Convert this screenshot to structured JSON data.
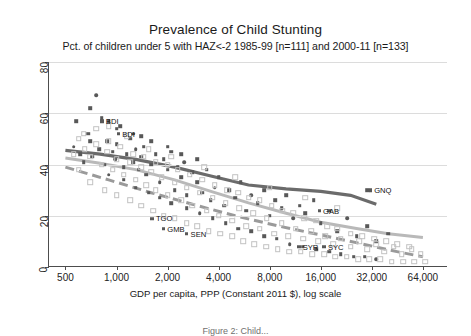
{
  "chart_data": {
    "type": "scatter",
    "title": "Prevalence of Child Stunting",
    "subtitle": "Pct. of children under 5 with HAZ<-2 1985-99 [n=111] and 2000-11 [n=133]",
    "xlabel": "GDP per capita, PPP (Constant 2011 $), log scale",
    "ylabel": "",
    "xscale": "log",
    "xlim": [
      400,
      90000
    ],
    "ylim": [
      0,
      80
    ],
    "xticks": [
      500,
      1000,
      2000,
      4000,
      8000,
      16000,
      32000,
      64000
    ],
    "xticklabels": [
      "500",
      "1,000",
      "2,000",
      "4,000",
      "8,000",
      "16,000",
      "32,000",
      "64,000"
    ],
    "yticks": [
      0,
      20,
      40,
      60,
      80
    ],
    "yticklabels": [
      "0",
      "20",
      "40",
      "60",
      "80"
    ],
    "grid": "horizontal",
    "legend": "none",
    "colors": {
      "series_1985_99": "#585858",
      "series_2000_11": "#c2c2c2",
      "fit_1985_99": "#6b6b6b",
      "fit_2000_11": "#b9b9b9",
      "fit_dashed": "#9a9a9a",
      "gridline": "#dcdcdc",
      "axis": "#4d4d4d"
    },
    "series": [
      {
        "name": "1985-99",
        "n": 111,
        "marker": "filled-square",
        "color": "#585858",
        "points": [
          [
            560,
            47
          ],
          [
            580,
            57
          ],
          [
            610,
            44
          ],
          [
            640,
            41
          ],
          [
            680,
            52
          ],
          [
            700,
            62
          ],
          [
            720,
            43
          ],
          [
            760,
            67
          ],
          [
            790,
            46
          ],
          [
            820,
            58
          ],
          [
            850,
            40
          ],
          [
            880,
            49
          ],
          [
            900,
            57
          ],
          [
            950,
            45
          ],
          [
            980,
            42
          ],
          [
            1000,
            48
          ],
          [
            1050,
            55
          ],
          [
            1100,
            39
          ],
          [
            1150,
            44
          ],
          [
            1200,
            50
          ],
          [
            1250,
            41
          ],
          [
            1300,
            46
          ],
          [
            1350,
            38
          ],
          [
            1400,
            43
          ],
          [
            1450,
            47
          ],
          [
            1500,
            36
          ],
          [
            1600,
            40
          ],
          [
            1700,
            44
          ],
          [
            1800,
            33
          ],
          [
            1900,
            42
          ],
          [
            2000,
            38
          ],
          [
            2100,
            45
          ],
          [
            2200,
            30
          ],
          [
            2300,
            39
          ],
          [
            2400,
            35
          ],
          [
            2500,
            41
          ],
          [
            2600,
            28
          ],
          [
            2800,
            37
          ],
          [
            3000,
            33
          ],
          [
            3200,
            29
          ],
          [
            3400,
            38
          ],
          [
            3600,
            26
          ],
          [
            3800,
            31
          ],
          [
            4000,
            35
          ],
          [
            4300,
            24
          ],
          [
            4600,
            30
          ],
          [
            5000,
            27
          ],
          [
            5400,
            33
          ],
          [
            5800,
            22
          ],
          [
            6200,
            28
          ],
          [
            6800,
            25
          ],
          [
            7400,
            30
          ],
          [
            8000,
            20
          ],
          [
            8600,
            26
          ],
          [
            9400,
            23
          ],
          [
            10000,
            28
          ],
          [
            11000,
            19
          ],
          [
            12000,
            24
          ],
          [
            13000,
            21
          ],
          [
            14500,
            26
          ],
          [
            16000,
            17
          ],
          [
            18000,
            22
          ],
          [
            20000,
            14
          ],
          [
            23000,
            19
          ],
          [
            26000,
            12
          ],
          [
            30000,
            16
          ],
          [
            34000,
            10
          ],
          [
            40000,
            13
          ],
          [
            30000,
            30
          ],
          [
            1000,
            54
          ],
          [
            1250,
            52
          ],
          [
            1400,
            51
          ],
          [
            700,
            49
          ],
          [
            1600,
            49
          ],
          [
            2000,
            47
          ],
          [
            2400,
            44
          ],
          [
            3000,
            42
          ],
          [
            900,
            36
          ],
          [
            1100,
            34
          ],
          [
            1300,
            31
          ],
          [
            1550,
            29
          ],
          [
            1800,
            27
          ],
          [
            2100,
            25
          ],
          [
            2600,
            23
          ],
          [
            3100,
            21
          ],
          [
            3700,
            19
          ],
          [
            4400,
            17
          ],
          [
            5200,
            15
          ],
          [
            6200,
            14
          ],
          [
            7400,
            12
          ],
          [
            8800,
            11
          ],
          [
            10500,
            9
          ],
          [
            12500,
            8
          ],
          [
            15000,
            7
          ],
          [
            18000,
            6
          ],
          [
            21000,
            5
          ],
          [
            25000,
            4
          ],
          [
            29000,
            4
          ],
          [
            34000,
            3
          ]
        ]
      },
      {
        "name": "2000-11",
        "n": 133,
        "marker": "open-square",
        "color": "#c2c2c2",
        "points": [
          [
            600,
            50
          ],
          [
            650,
            46
          ],
          [
            700,
            43
          ],
          [
            760,
            48
          ],
          [
            820,
            40
          ],
          [
            880,
            45
          ],
          [
            950,
            38
          ],
          [
            1000,
            42
          ],
          [
            1100,
            36
          ],
          [
            1200,
            41
          ],
          [
            1300,
            34
          ],
          [
            1400,
            39
          ],
          [
            1500,
            32
          ],
          [
            1600,
            37
          ],
          [
            1700,
            30
          ],
          [
            1850,
            35
          ],
          [
            2000,
            28
          ],
          [
            2200,
            33
          ],
          [
            2400,
            26
          ],
          [
            2600,
            31
          ],
          [
            2800,
            24
          ],
          [
            3100,
            29
          ],
          [
            3400,
            22
          ],
          [
            3700,
            27
          ],
          [
            4000,
            20
          ],
          [
            4400,
            25
          ],
          [
            4800,
            18
          ],
          [
            5300,
            23
          ],
          [
            5800,
            16
          ],
          [
            6400,
            21
          ],
          [
            7000,
            15
          ],
          [
            7700,
            19
          ],
          [
            8500,
            13
          ],
          [
            9400,
            17
          ],
          [
            10300,
            12
          ],
          [
            11400,
            15
          ],
          [
            12600,
            11
          ],
          [
            14000,
            14
          ],
          [
            15500,
            10
          ],
          [
            17000,
            12
          ],
          [
            19000,
            9
          ],
          [
            21000,
            11
          ],
          [
            24000,
            8
          ],
          [
            27000,
            10
          ],
          [
            30000,
            7
          ],
          [
            34000,
            9
          ],
          [
            38000,
            6
          ],
          [
            43000,
            8
          ],
          [
            48000,
            5
          ],
          [
            55000,
            7
          ],
          [
            62000,
            5
          ],
          [
            560,
            44
          ],
          [
            640,
            52
          ],
          [
            760,
            54
          ],
          [
            900,
            49
          ],
          [
            1050,
            47
          ],
          [
            1250,
            44
          ],
          [
            1450,
            43
          ],
          [
            1700,
            41
          ],
          [
            2000,
            40
          ],
          [
            2300,
            38
          ],
          [
            2700,
            36
          ],
          [
            3200,
            34
          ],
          [
            3800,
            32
          ],
          [
            4500,
            30
          ],
          [
            5200,
            29
          ],
          [
            6000,
            27
          ],
          [
            7000,
            26
          ],
          [
            8200,
            24
          ],
          [
            9500,
            22
          ],
          [
            11000,
            21
          ],
          [
            12800,
            19
          ],
          [
            15000,
            18
          ],
          [
            17500,
            16
          ],
          [
            20000,
            15
          ],
          [
            24000,
            13
          ],
          [
            28000,
            12
          ],
          [
            33000,
            11
          ],
          [
            39000,
            10
          ],
          [
            45000,
            9
          ],
          [
            53000,
            8
          ],
          [
            700,
            33
          ],
          [
            850,
            30
          ],
          [
            1000,
            28
          ],
          [
            1200,
            26
          ],
          [
            1400,
            24
          ],
          [
            1650,
            22
          ],
          [
            1900,
            20
          ],
          [
            2200,
            19
          ],
          [
            2600,
            17
          ],
          [
            3000,
            16
          ],
          [
            3500,
            14
          ],
          [
            4100,
            13
          ],
          [
            4800,
            12
          ],
          [
            5600,
            10
          ],
          [
            6500,
            9
          ],
          [
            7600,
            8
          ],
          [
            8900,
            7
          ],
          [
            10400,
            6
          ],
          [
            12200,
            6
          ],
          [
            14300,
            5
          ],
          [
            16700,
            5
          ],
          [
            19500,
            4
          ],
          [
            22800,
            4
          ],
          [
            26700,
            3
          ],
          [
            31000,
            3
          ],
          [
            36000,
            3
          ],
          [
            42000,
            2
          ],
          [
            49000,
            2
          ],
          [
            57000,
            2
          ],
          [
            66000,
            2
          ],
          [
            600,
            38
          ],
          [
            900,
            55
          ],
          [
            1150,
            51
          ],
          [
            1550,
            46
          ],
          [
            2100,
            43
          ],
          [
            3300,
            39
          ],
          [
            5000,
            35
          ],
          [
            8000,
            31
          ],
          [
            13000,
            27
          ],
          [
            20000,
            23
          ]
        ]
      }
    ],
    "fit_lines": [
      {
        "name": "fit-1985-99-solid-dark",
        "style": "solid",
        "color": "#6b6b6b",
        "width": 3.2,
        "points": [
          [
            500,
            45.5
          ],
          [
            800,
            44.0
          ],
          [
            1300,
            42.0
          ],
          [
            2200,
            39.0
          ],
          [
            3600,
            35.5
          ],
          [
            6000,
            32.0
          ],
          [
            10000,
            30.5
          ],
          [
            16000,
            29.5
          ],
          [
            24000,
            28.0
          ],
          [
            34000,
            24.5
          ]
        ]
      },
      {
        "name": "fit-1985-99-solid-light",
        "style": "solid",
        "color": "#b9b9b9",
        "width": 3.0,
        "points": [
          [
            500,
            42.5
          ],
          [
            800,
            40.5
          ],
          [
            1300,
            38.0
          ],
          [
            2200,
            34.0
          ],
          [
            3600,
            29.5
          ],
          [
            6000,
            25.0
          ],
          [
            10000,
            21.0
          ],
          [
            16000,
            17.5
          ],
          [
            26000,
            15.0
          ],
          [
            40000,
            13.0
          ],
          [
            64000,
            11.5
          ]
        ]
      },
      {
        "name": "fit-2000-11-dashed",
        "style": "dashed",
        "color": "#9a9a9a",
        "width": 3.0,
        "points": [
          [
            500,
            39.0
          ],
          [
            900,
            34.0
          ],
          [
            1600,
            29.0
          ],
          [
            2800,
            24.5
          ],
          [
            5000,
            20.0
          ],
          [
            9000,
            16.0
          ],
          [
            16000,
            12.5
          ],
          [
            28000,
            9.0
          ],
          [
            45000,
            6.0
          ],
          [
            64000,
            4.0
          ]
        ]
      }
    ],
    "point_labels": [
      {
        "code": "BDI",
        "x": 760,
        "y": 57
      },
      {
        "code": "BDI",
        "x": 950,
        "y": 52
      },
      {
        "code": "TGO",
        "x": 1500,
        "y": 19
      },
      {
        "code": "GMB",
        "x": 1750,
        "y": 15
      },
      {
        "code": "SEN",
        "x": 2400,
        "y": 13
      },
      {
        "code": "GNQ",
        "x": 29000,
        "y": 30
      },
      {
        "code": "GAB",
        "x": 14500,
        "y": 22
      },
      {
        "code": "SYR",
        "x": 11000,
        "y": 8
      },
      {
        "code": "SYC",
        "x": 15500,
        "y": 8
      }
    ],
    "caption": "Figure 2: Child..."
  }
}
